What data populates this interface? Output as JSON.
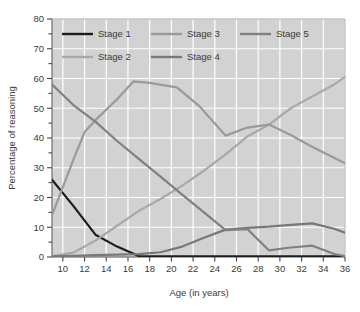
{
  "chart_data": {
    "type": "line",
    "title": "",
    "xlabel": "Age (in years)",
    "ylabel": "Percentage of reasoning",
    "xlim": [
      9,
      36
    ],
    "ylim": [
      0,
      80
    ],
    "xticks": [
      10,
      12,
      14,
      16,
      18,
      20,
      22,
      24,
      26,
      28,
      30,
      32,
      34,
      36
    ],
    "yticks": [
      0,
      10,
      20,
      30,
      40,
      50,
      60,
      70,
      80
    ],
    "xtick_labels": [
      "10",
      "12",
      "14",
      "16",
      "18",
      "20",
      "22",
      "24",
      "26",
      "28",
      "30",
      "32",
      "34",
      "36"
    ],
    "ytick_labels": [
      "0",
      "10",
      "20",
      "30",
      "40",
      "50",
      "60",
      "70",
      "80"
    ],
    "grid": true,
    "grid_color": "#ffffff",
    "plot_background": "#d2d2d2",
    "legend_position": "top-inside",
    "minor_yticks_step": 5,
    "series": [
      {
        "name": "Stage 1",
        "color": "#1c1c1c",
        "x": [
          9,
          11,
          13,
          15,
          17,
          19,
          36
        ],
        "values": [
          26,
          17,
          7.5,
          3.5,
          0.3,
          0.2,
          0.2
        ]
      },
      {
        "name": "Stage 2",
        "color": "#a8a8a8",
        "x": [
          9,
          11,
          13,
          15,
          17,
          19,
          21,
          23,
          25,
          27,
          29,
          31,
          33,
          35,
          36
        ],
        "values": [
          0.3,
          1.5,
          5.5,
          10.5,
          15.5,
          19.5,
          24,
          29,
          34.5,
          40.5,
          44.5,
          50,
          54,
          58,
          60.5
        ]
      },
      {
        "name": "Stage 3",
        "color": "#9a9a9a",
        "x": [
          9,
          11,
          12,
          13,
          15,
          16.5,
          18,
          20.5,
          22.5,
          25,
          27,
          29,
          31,
          33,
          36
        ],
        "values": [
          14,
          33,
          42,
          46,
          53,
          59,
          58.5,
          57,
          51,
          40.8,
          43.5,
          44.5,
          41,
          37,
          31.5
        ]
      },
      {
        "name": "Stage 4",
        "color": "#787878",
        "x": [
          9,
          11,
          13,
          15,
          17,
          19,
          21,
          23,
          25,
          27,
          29,
          31,
          33,
          35,
          36
        ],
        "values": [
          0.2,
          0.4,
          0.6,
          0.8,
          1.0,
          1.6,
          3.5,
          6.5,
          9.2,
          9.8,
          10.2,
          10.8,
          11.3,
          9.5,
          8.2
        ]
      },
      {
        "name": "Stage 5",
        "color": "#808080",
        "x": [
          9,
          11,
          13,
          15,
          17,
          19,
          21,
          23,
          25,
          27,
          29,
          31,
          33,
          35,
          36
        ],
        "values": [
          58,
          51,
          45.5,
          39,
          33,
          27,
          21,
          15,
          9,
          9.4,
          2.2,
          3.2,
          3.8,
          1.0,
          0.3
        ]
      }
    ]
  },
  "legend": {
    "entries": [
      {
        "label": "Stage 1",
        "color": "#1c1c1c"
      },
      {
        "label": "Stage 2",
        "color": "#a8a8a8"
      },
      {
        "label": "Stage 3",
        "color": "#9a9a9a"
      },
      {
        "label": "Stage 4",
        "color": "#787878"
      },
      {
        "label": "Stage 5",
        "color": "#808080"
      }
    ]
  },
  "axes": {
    "x_title": "Age (in years)",
    "y_title": "Percentage of reasoning"
  }
}
